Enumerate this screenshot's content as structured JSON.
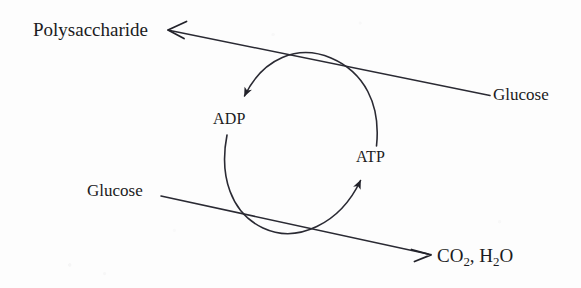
{
  "diagram": {
    "background_color": "#fdfdfd",
    "ink_color": "#1b1b22",
    "nodes": {
      "polysaccharide": "Polysaccharide",
      "glucose_right": "Glucose",
      "glucose_left": "Glucose",
      "adp": "ADP",
      "atp": "ATP",
      "co2_h2o_formula": "CO",
      "co2_sub": "2",
      "co2_separator": ", H",
      "h2o_sub": "2",
      "h2o_end": "O"
    },
    "arrows": [
      {
        "name": "glucose-to-polysaccharide",
        "from": "Glucose",
        "to": "Polysaccharide",
        "style": "straight-line",
        "arrowhead": "open-barb",
        "direction": "right-to-left-upward"
      },
      {
        "name": "glucose-to-co2-water",
        "from": "Glucose",
        "to": "CO2, H2O",
        "style": "straight-line",
        "arrowhead": "open-barb",
        "direction": "left-to-right-downward"
      },
      {
        "name": "atp-to-adp-arc",
        "from": "ATP",
        "to": "ADP",
        "style": "curved-arc",
        "arrowhead": "solid-triangle",
        "direction": "counterclockwise-top"
      },
      {
        "name": "adp-to-atp-arc",
        "from": "ADP",
        "to": "ATP",
        "style": "curved-arc",
        "arrowhead": "solid-triangle",
        "direction": "counterclockwise-bottom"
      }
    ]
  }
}
